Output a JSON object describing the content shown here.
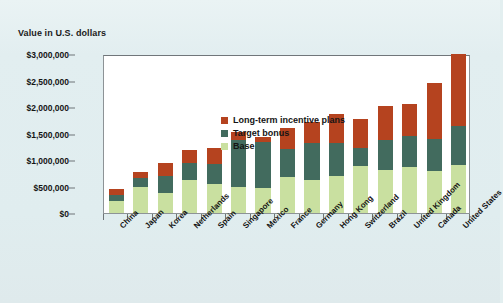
{
  "axis_title": "Value in U.S. dollars",
  "legend": {
    "items": [
      {
        "label": "Long-term incentive plans",
        "color": "#b5431f",
        "key": "ltip"
      },
      {
        "label": "Target bonus",
        "color": "#426b5e",
        "key": "bonus"
      },
      {
        "label": "Base",
        "color": "#c9e0a0",
        "key": "base"
      }
    ]
  },
  "yaxis": {
    "ticks": [
      "$3,000,000",
      "$2,500,000",
      "$2,000,000",
      "$1,500,000",
      "$1,000,000",
      "$500,000",
      "$0"
    ],
    "values": [
      3000000,
      2500000,
      2000000,
      1500000,
      1000000,
      500000,
      0
    ]
  },
  "chart_data": {
    "type": "bar",
    "stacked": true,
    "title": "",
    "subtitle": "",
    "xlabel": "",
    "ylabel": "Value in U.S. dollars",
    "ylim": [
      0,
      3000000
    ],
    "ytick_step": 500000,
    "grid": false,
    "legend_position": "top-left-inside",
    "categories": [
      "China",
      "Japan",
      "Korea",
      "Netherlands",
      "Spain",
      "Singapore",
      "Mexico",
      "France",
      "Germany",
      "Hong Kong",
      "Switzerland",
      "Brazil",
      "United Kingdom",
      "Canada",
      "United States"
    ],
    "series": [
      {
        "name": "Base",
        "color": "#c9e0a0",
        "values": [
          225000,
          500000,
          380000,
          620000,
          540000,
          500000,
          470000,
          680000,
          620000,
          700000,
          890000,
          810000,
          860000,
          800000,
          910000
        ]
      },
      {
        "name": "Target bonus",
        "color": "#426b5e",
        "values": [
          115000,
          155000,
          320000,
          330000,
          380000,
          870000,
          870000,
          520000,
          700000,
          620000,
          330000,
          560000,
          600000,
          600000,
          740000
        ]
      },
      {
        "name": "Long-term incentive plans",
        "color": "#b5431f",
        "values": [
          110000,
          125000,
          250000,
          230000,
          300000,
          160000,
          90000,
          410000,
          400000,
          550000,
          560000,
          650000,
          600000,
          1060000,
          1350000
        ]
      }
    ],
    "totals": [
      450000,
      780000,
      950000,
      1180000,
      1220000,
      1530000,
      1430000,
      1610000,
      1720000,
      1870000,
      1780000,
      2020000,
      2060000,
      2460000,
      3000000
    ]
  }
}
